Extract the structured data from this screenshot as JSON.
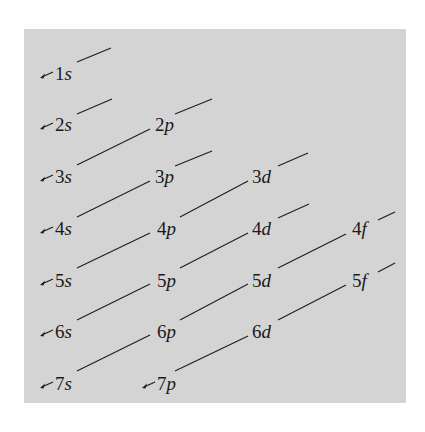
{
  "diagram": {
    "background_color": "#d4d4d4",
    "line_color": "#1e1e1e",
    "orbitals": [
      {
        "id": "1s",
        "n": "1",
        "l": "s",
        "x": 55,
        "y": 80,
        "arrow": true
      },
      {
        "id": "2s",
        "n": "2",
        "l": "s",
        "x": 55,
        "y": 131,
        "arrow": true
      },
      {
        "id": "2p",
        "n": "2",
        "l": "p",
        "x": 155,
        "y": 131,
        "arrow": false
      },
      {
        "id": "3s",
        "n": "3",
        "l": "s",
        "x": 55,
        "y": 183,
        "arrow": true
      },
      {
        "id": "3p",
        "n": "3",
        "l": "p",
        "x": 155,
        "y": 183,
        "arrow": false
      },
      {
        "id": "3d",
        "n": "3",
        "l": "d",
        "x": 252,
        "y": 183,
        "arrow": false
      },
      {
        "id": "4s",
        "n": "4",
        "l": "s",
        "x": 55,
        "y": 235,
        "arrow": true
      },
      {
        "id": "4p",
        "n": "4",
        "l": "p",
        "x": 157,
        "y": 235,
        "arrow": false
      },
      {
        "id": "4d",
        "n": "4",
        "l": "d",
        "x": 252,
        "y": 235,
        "arrow": false
      },
      {
        "id": "4f",
        "n": "4",
        "l": "f",
        "x": 352,
        "y": 235,
        "arrow": false
      },
      {
        "id": "5s",
        "n": "5",
        "l": "s",
        "x": 55,
        "y": 287,
        "arrow": true
      },
      {
        "id": "5p",
        "n": "5",
        "l": "p",
        "x": 157,
        "y": 287,
        "arrow": false
      },
      {
        "id": "5d",
        "n": "5",
        "l": "d",
        "x": 252,
        "y": 287,
        "arrow": false
      },
      {
        "id": "5f",
        "n": "5",
        "l": "f",
        "x": 352,
        "y": 287,
        "arrow": false
      },
      {
        "id": "6s",
        "n": "6",
        "l": "s",
        "x": 55,
        "y": 338,
        "arrow": true
      },
      {
        "id": "6p",
        "n": "6",
        "l": "p",
        "x": 157,
        "y": 338,
        "arrow": false
      },
      {
        "id": "6d",
        "n": "6",
        "l": "d",
        "x": 252,
        "y": 338,
        "arrow": false
      },
      {
        "id": "7s",
        "n": "7",
        "l": "s",
        "x": 55,
        "y": 390,
        "arrow": true
      },
      {
        "id": "7p",
        "n": "7",
        "l": "p",
        "x": 157,
        "y": 390,
        "arrow": true
      }
    ],
    "connectors": [
      {
        "from": "1s",
        "x1": 77,
        "y1": 62,
        "x2": 111,
        "y2": 48
      },
      {
        "from": "2s",
        "x1": 77,
        "y1": 114,
        "x2": 112,
        "y2": 99
      },
      {
        "from": "2p",
        "x1": 175,
        "y1": 114,
        "x2": 212,
        "y2": 99
      },
      {
        "from": "3s",
        "to": "2p",
        "x1": 77,
        "y1": 165,
        "x2": 150,
        "y2": 129
      },
      {
        "from": "3p",
        "x1": 175,
        "y1": 166,
        "x2": 212,
        "y2": 151
      },
      {
        "from": "3d",
        "x1": 278,
        "y1": 166,
        "x2": 308,
        "y2": 153
      },
      {
        "from": "4s",
        "to": "3p",
        "x1": 77,
        "y1": 217,
        "x2": 150,
        "y2": 181
      },
      {
        "from": "4p",
        "to": "3d",
        "x1": 180,
        "y1": 217,
        "x2": 248,
        "y2": 181
      },
      {
        "from": "4d",
        "x1": 278,
        "y1": 218,
        "x2": 309,
        "y2": 204
      },
      {
        "from": "4f",
        "x1": 378,
        "y1": 220,
        "x2": 395,
        "y2": 212
      },
      {
        "from": "5s",
        "to": "4p",
        "x1": 77,
        "y1": 268,
        "x2": 150,
        "y2": 233
      },
      {
        "from": "5p",
        "to": "4d",
        "x1": 180,
        "y1": 268,
        "x2": 248,
        "y2": 233
      },
      {
        "from": "5d",
        "to": "4f",
        "x1": 278,
        "y1": 268,
        "x2": 346,
        "y2": 234
      },
      {
        "from": "5f",
        "x1": 378,
        "y1": 272,
        "x2": 395,
        "y2": 263
      },
      {
        "from": "6s",
        "to": "5p",
        "x1": 77,
        "y1": 320,
        "x2": 150,
        "y2": 284
      },
      {
        "from": "6p",
        "to": "5d",
        "x1": 180,
        "y1": 320,
        "x2": 248,
        "y2": 284
      },
      {
        "from": "6d",
        "to": "5f",
        "x1": 278,
        "y1": 320,
        "x2": 346,
        "y2": 285
      },
      {
        "from": "7s",
        "to": "6p",
        "x1": 77,
        "y1": 371,
        "x2": 150,
        "y2": 335
      },
      {
        "from": "7p",
        "to": "6d",
        "x1": 175,
        "y1": 371,
        "x2": 248,
        "y2": 336
      }
    ]
  }
}
